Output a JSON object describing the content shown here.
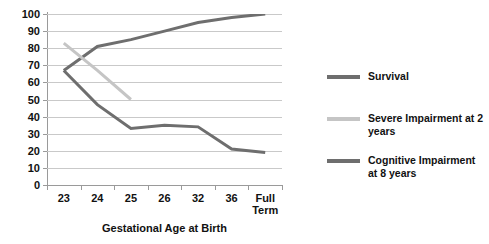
{
  "chart_data": {
    "type": "line",
    "title": "",
    "xlabel": "Gestational Age at Birth",
    "ylabel": "",
    "categories": [
      "23",
      "24",
      "25",
      "26",
      "32",
      "36",
      "Full Term"
    ],
    "ylim": [
      0,
      100
    ],
    "yticks": [
      0,
      10,
      20,
      30,
      40,
      50,
      60,
      70,
      80,
      90,
      100
    ],
    "grid": true,
    "legend_position": "right",
    "series": [
      {
        "name": "Survival",
        "color": "#6e6e6e",
        "values": [
          67,
          81,
          85,
          90,
          95,
          98,
          100
        ]
      },
      {
        "name": "Severe Impairment at 2 years",
        "color": "#c5c5c5",
        "values": [
          83,
          67,
          50,
          null,
          null,
          null,
          null
        ]
      },
      {
        "name": "Cognitive Impairment at 8 years",
        "color": "#6e6e6e",
        "values": [
          67,
          47,
          33,
          35,
          34,
          21,
          19
        ]
      }
    ]
  },
  "legend": {
    "items": [
      {
        "label": "Survival",
        "color": "#6e6e6e"
      },
      {
        "label": "Severe Impairment at 2 years",
        "color": "#c5c5c5"
      },
      {
        "label": "Cognitive Impairment at 8 years",
        "color": "#6e6e6e"
      }
    ]
  },
  "axis": {
    "x_title": "Gestational Age at Birth"
  }
}
